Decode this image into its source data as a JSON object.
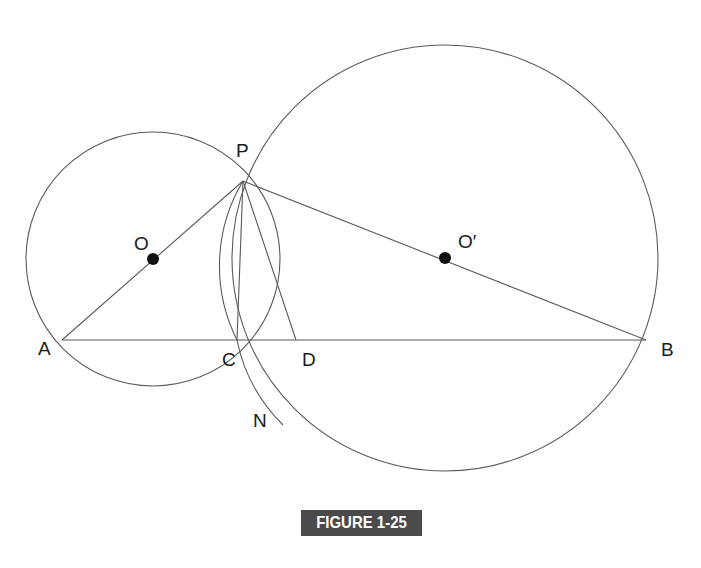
{
  "figure": {
    "caption": "FIGURE 1-25",
    "caption_bg": "#4a4a4a",
    "caption_color": "#ffffff",
    "line_color": "#5a5a5a",
    "point_color": "#111111"
  },
  "points": {
    "P": {
      "label": "P"
    },
    "A": {
      "label": "A"
    },
    "B": {
      "label": "B"
    },
    "C": {
      "label": "C"
    },
    "D": {
      "label": "D"
    },
    "N": {
      "label": "N"
    },
    "O": {
      "label": "O"
    },
    "O_prime": {
      "label": "O′"
    }
  },
  "circles": [
    {
      "name": "circle-O",
      "center": "O",
      "through": [
        "A",
        "P",
        "D"
      ]
    },
    {
      "name": "circle-O-prime",
      "center": "O′",
      "through": [
        "P",
        "B",
        "N"
      ]
    },
    {
      "name": "circle-P",
      "center": "P",
      "through": [
        "C",
        "N"
      ]
    }
  ],
  "segments": [
    [
      "A",
      "P"
    ],
    [
      "P",
      "B"
    ],
    [
      "A",
      "B"
    ],
    [
      "P",
      "C"
    ],
    [
      "P",
      "D"
    ]
  ]
}
